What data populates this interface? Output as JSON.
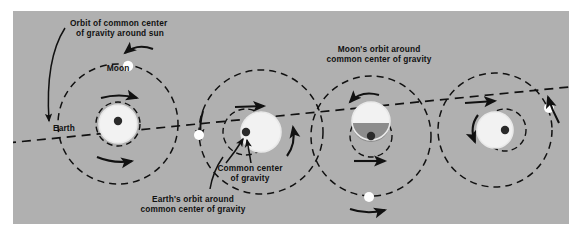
{
  "figure": {
    "kind": "astronomy-diagram",
    "title_text": "",
    "panel": {
      "background_color": "#b0b0b0",
      "page_background_color": "#ffffff",
      "ink_color": "#111111",
      "body_fill_color": "#f2f2f2",
      "body_shadow_color": "#8d8d8d",
      "highlight_ring_color": "#f2f2f2"
    }
  },
  "labels": {
    "orbit_around_sun": {
      "line1": "Orbit of common center",
      "line2": "of gravity around sun"
    },
    "moon": "Moon",
    "earth": "Earth",
    "common_center_of_gravity": {
      "line1": "Common center",
      "line2": "of gravity"
    },
    "earth_orbit": {
      "line1": "Earth's orbit around",
      "line2": "common center of gravity"
    },
    "moon_orbit": {
      "line1": "Moon's orbit around",
      "line2": "common center of gravity"
    }
  },
  "diagram_data": {
    "type": "diagram",
    "description": "Four successive phases of the Earth-Moon system travelling along the dashed orbit of their common center of gravity around the sun.",
    "ecliptic_path": {
      "style": "dashed",
      "note": "Orbit of common center of gravity around sun - a long dashed line sloping gently upward from lower-left to upper-right across the panel"
    },
    "phases": [
      {
        "index": 1,
        "center": [
          105,
          113
        ],
        "moon_orbit_radius": 60,
        "earth_orbit_radius": 22,
        "earth_radius": 19,
        "barycenter": [
          105,
          113
        ],
        "moon_position_deg": 80,
        "moon_label_shown": true,
        "earth_label_shown": true,
        "arrows": [
          "moon-orbit-direction",
          "earth-orbit-direction"
        ]
      },
      {
        "index": 2,
        "center": [
          245,
          123
        ],
        "moon_orbit_radius": 60,
        "earth_orbit_radius": 22,
        "earth_radius": 19,
        "barycenter": [
          245,
          123
        ],
        "moon_position_deg": 180,
        "moon_label_shown": false,
        "earth_label_shown": false,
        "arrows": [
          "moon-orbit-direction",
          "earth-orbit-direction"
        ]
      },
      {
        "index": 3,
        "center": [
          372,
          130
        ],
        "moon_orbit_radius": 57,
        "earth_orbit_radius": 20,
        "earth_radius": 18,
        "barycenter": [
          372,
          130
        ],
        "moon_position_deg": 270,
        "moon_label_shown": false,
        "earth_label_shown": false,
        "arrows": [
          "moon-orbit-direction",
          "earth-orbit-direction"
        ]
      },
      {
        "index": 4,
        "center": [
          487,
          124
        ],
        "moon_orbit_radius": 55,
        "earth_orbit_radius": 20,
        "earth_radius": 18,
        "barycenter": [
          487,
          124
        ],
        "moon_position_deg": 0,
        "moon_label_shown": false,
        "earth_label_shown": false,
        "arrows": [
          "moon-orbit-direction",
          "earth-orbit-direction"
        ]
      }
    ],
    "legend_items": [
      "Orbit of common center of gravity around sun",
      "Moon's orbit around common center of gravity",
      "Earth's orbit around common center of gravity",
      "Common center of gravity"
    ]
  }
}
